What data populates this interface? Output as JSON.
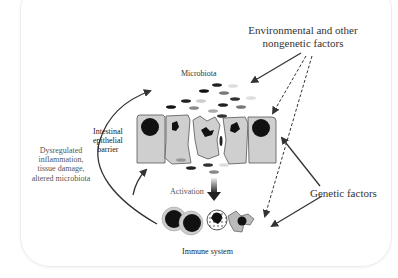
{
  "labels": {
    "environmental": "Environmental and other",
    "environmental_line2": "nongenetic factors",
    "microbiota": "Microbiota",
    "barrier_line1": "Intestinal",
    "barrier_line2": "epithelial",
    "barrier_line3": "barrier",
    "dysregulated_line1": "Dysregulated",
    "dysregulated_line2": "inflammation,",
    "dysregulated_line3": "tissue damage,",
    "dysregulated_line4": "altered microbiota",
    "activation": "Activation",
    "genetic": "Genetic factors",
    "immune": "Immune system"
  },
  "colors": {
    "cell_fill": "#cfcfcf",
    "cell_stroke": "#555555",
    "nucleus": "#111111",
    "arrow": "#333333",
    "bacteria_dark": "#222222",
    "bacteria_mid": "#777777",
    "bacteria_light": "#c8c8c8"
  }
}
